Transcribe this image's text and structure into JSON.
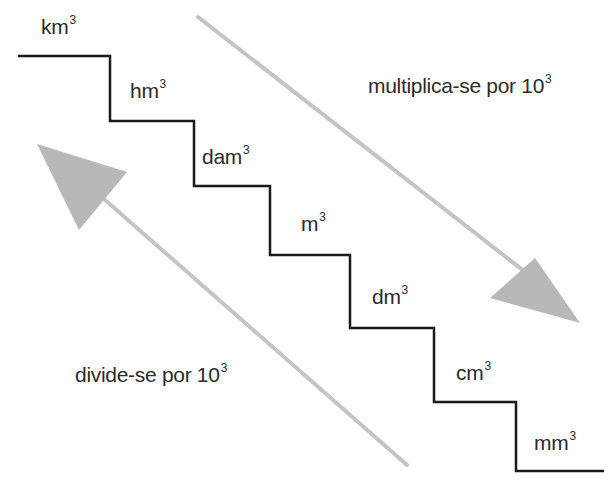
{
  "diagram": {
    "type": "staircase-unit-conversion",
    "units": [
      {
        "base": "km",
        "exp": "3"
      },
      {
        "base": "hm",
        "exp": "3"
      },
      {
        "base": "dam",
        "exp": "3"
      },
      {
        "base": "m",
        "exp": "3"
      },
      {
        "base": "dm",
        "exp": "3"
      },
      {
        "base": "cm",
        "exp": "3"
      },
      {
        "base": "mm",
        "exp": "3"
      }
    ],
    "down_arrow": {
      "text": "multiplica-se por 10",
      "exp": "3"
    },
    "up_arrow": {
      "text": "divide-se por 10",
      "exp": "3"
    },
    "colors": {
      "stair": "#1a1a1a",
      "arrow": "#bdbdbd",
      "text": "#2b2b2b"
    }
  }
}
